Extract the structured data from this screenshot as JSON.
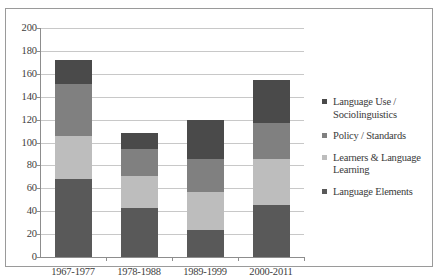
{
  "chart_data": {
    "type": "bar",
    "subtype": "stacked-vertical",
    "title": "",
    "xlabel": "",
    "ylabel": "",
    "ylim": [
      0,
      200
    ],
    "ytick_step": 20,
    "ytick_labels": [
      "200",
      "180",
      "160",
      "140",
      "120",
      "100",
      "80",
      "60",
      "40",
      "20",
      "0"
    ],
    "grid": "horizontal",
    "legend_position": "right",
    "categories": [
      "1967-1977",
      "1978-1988",
      "1989-1999",
      "2000-2011"
    ],
    "stack_order_bottom_to_top": [
      "Language Elements",
      "Learners & Language Learning",
      "Policy / Standards",
      "Language Use / Sociolinguistics"
    ],
    "series": [
      {
        "name": "Language Use / Sociolinguistics",
        "color": "#4a4a4a",
        "values": [
          21,
          14,
          34,
          38
        ]
      },
      {
        "name": "Policy / Standards",
        "color": "#808080",
        "values": [
          45,
          23,
          29,
          31
        ]
      },
      {
        "name": "Learners & Language Learning",
        "color": "#bdbdbd",
        "values": [
          38,
          28,
          33,
          41
        ]
      },
      {
        "name": "Language Elements",
        "color": "#595959",
        "values": [
          68,
          43,
          24,
          45
        ]
      }
    ],
    "totals": [
      172,
      108,
      120,
      155
    ]
  },
  "legend": {
    "items": [
      {
        "label": "Language Use / Sociolinguistics",
        "color": "#4a4a4a"
      },
      {
        "label": "Policy / Standards",
        "color": "#808080"
      },
      {
        "label": "Learners & Language Learning",
        "color": "#bdbdbd"
      },
      {
        "label": "Language Elements",
        "color": "#595959"
      }
    ]
  }
}
